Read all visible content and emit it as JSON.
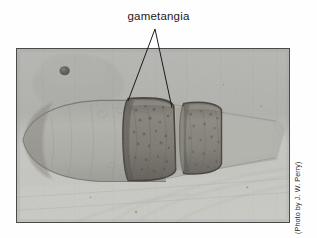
{
  "figure": {
    "kind": "photomicrograph-figure",
    "background_color": "#ffffff",
    "label": {
      "text": "gametangia",
      "color": "#1b1b1b"
    },
    "credit": {
      "text": "(Photo by J. W. Perry)",
      "color": "#2b2b2b",
      "orientation": "vertical-right"
    },
    "photo": {
      "frame_color": "#4a4a4a",
      "tone_light": "#cfcfcb",
      "tone_mid": "#b2b2ae",
      "tone_dark": "#5d5a54",
      "subject": "filamentous alga with two adjacent gametangia"
    },
    "leaders": {
      "stroke_color": "#1b1b1b",
      "apex": {
        "x": 155,
        "y": 29
      },
      "left_end": {
        "x": 128,
        "y": 101
      },
      "right_end": {
        "x": 172,
        "y": 108
      }
    }
  }
}
